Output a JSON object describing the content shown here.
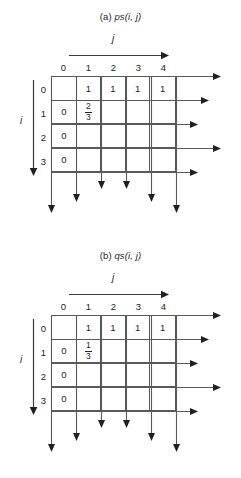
{
  "figure": {
    "panels": [
      {
        "id": "a",
        "caption_prefix": "(a) ",
        "caption_fn": "ps",
        "caption_args": "(i, j)",
        "axis_x_label": "j",
        "axis_y_label": "i",
        "col_headers": [
          "0",
          "1",
          "2",
          "3",
          "4"
        ],
        "row_headers": [
          "0",
          "1",
          "2",
          "3"
        ],
        "cells": [
          [
            "",
            "1",
            "1",
            "1",
            "1"
          ],
          [
            "0",
            "2/3",
            "",
            "",
            ""
          ],
          [
            "0",
            "",
            "",
            "",
            ""
          ],
          [
            "0",
            "",
            "",
            "",
            ""
          ]
        ],
        "fraction_cell": {
          "row": 1,
          "col": 1,
          "numerator": "2",
          "denominator": "3"
        }
      },
      {
        "id": "b",
        "caption_prefix": "(b) ",
        "caption_fn": "qs",
        "caption_args": "(i, j)",
        "axis_x_label": "j",
        "axis_y_label": "i",
        "col_headers": [
          "0",
          "1",
          "2",
          "3",
          "4"
        ],
        "row_headers": [
          "0",
          "1",
          "2",
          "3"
        ],
        "cells": [
          [
            "",
            "1",
            "1",
            "1",
            "1"
          ],
          [
            "0",
            "1/3",
            "",
            "",
            ""
          ],
          [
            "0",
            "",
            "",
            "",
            ""
          ],
          [
            "0",
            "",
            "",
            "",
            ""
          ]
        ],
        "fraction_cell": {
          "row": 1,
          "col": 1,
          "numerator": "1",
          "denominator": "3"
        }
      }
    ],
    "colors": {
      "line": "#58595b",
      "text": "#231f20",
      "background": "#ffffff"
    }
  }
}
